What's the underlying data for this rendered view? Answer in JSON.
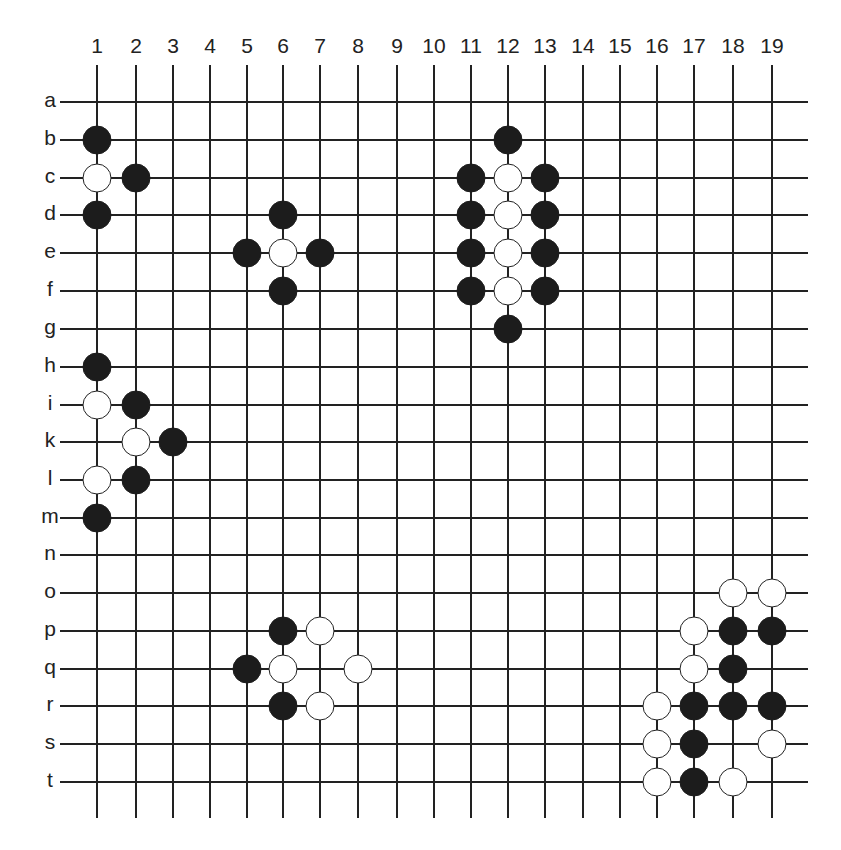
{
  "diagram": {
    "type": "go-board-diagram",
    "columns": [
      "1",
      "2",
      "3",
      "4",
      "5",
      "6",
      "7",
      "8",
      "9",
      "10",
      "11",
      "12",
      "13",
      "14",
      "15",
      "16",
      "17",
      "18",
      "19"
    ],
    "rows": [
      "a",
      "b",
      "c",
      "d",
      "e",
      "f",
      "g",
      "h",
      "i",
      "k",
      "l",
      "m",
      "n",
      "o",
      "p",
      "q",
      "r",
      "s",
      "t"
    ],
    "colors": {
      "black_stone": "#1c1c1c",
      "white_stone": "#ffffff",
      "grid": "#222222",
      "background": "#ffffff"
    },
    "stones": [
      {
        "row": "b",
        "col": 1,
        "color": "black"
      },
      {
        "row": "c",
        "col": 1,
        "color": "white"
      },
      {
        "row": "c",
        "col": 2,
        "color": "black"
      },
      {
        "row": "d",
        "col": 1,
        "color": "black"
      },
      {
        "row": "d",
        "col": 6,
        "color": "black"
      },
      {
        "row": "e",
        "col": 5,
        "color": "black"
      },
      {
        "row": "e",
        "col": 6,
        "color": "white"
      },
      {
        "row": "e",
        "col": 7,
        "color": "black"
      },
      {
        "row": "f",
        "col": 6,
        "color": "black"
      },
      {
        "row": "b",
        "col": 12,
        "color": "black"
      },
      {
        "row": "c",
        "col": 11,
        "color": "black"
      },
      {
        "row": "c",
        "col": 12,
        "color": "white"
      },
      {
        "row": "c",
        "col": 13,
        "color": "black"
      },
      {
        "row": "d",
        "col": 11,
        "color": "black"
      },
      {
        "row": "d",
        "col": 12,
        "color": "white"
      },
      {
        "row": "d",
        "col": 13,
        "color": "black"
      },
      {
        "row": "e",
        "col": 11,
        "color": "black"
      },
      {
        "row": "e",
        "col": 12,
        "color": "white"
      },
      {
        "row": "e",
        "col": 13,
        "color": "black"
      },
      {
        "row": "f",
        "col": 11,
        "color": "black"
      },
      {
        "row": "f",
        "col": 12,
        "color": "white"
      },
      {
        "row": "f",
        "col": 13,
        "color": "black"
      },
      {
        "row": "g",
        "col": 12,
        "color": "black"
      },
      {
        "row": "h",
        "col": 1,
        "color": "black"
      },
      {
        "row": "i",
        "col": 1,
        "color": "white"
      },
      {
        "row": "i",
        "col": 2,
        "color": "black"
      },
      {
        "row": "k",
        "col": 2,
        "color": "white"
      },
      {
        "row": "k",
        "col": 3,
        "color": "black"
      },
      {
        "row": "l",
        "col": 1,
        "color": "white"
      },
      {
        "row": "l",
        "col": 2,
        "color": "black"
      },
      {
        "row": "m",
        "col": 1,
        "color": "black"
      },
      {
        "row": "p",
        "col": 6,
        "color": "black"
      },
      {
        "row": "p",
        "col": 7,
        "color": "white"
      },
      {
        "row": "q",
        "col": 5,
        "color": "black"
      },
      {
        "row": "q",
        "col": 6,
        "color": "white"
      },
      {
        "row": "q",
        "col": 8,
        "color": "white"
      },
      {
        "row": "r",
        "col": 6,
        "color": "black"
      },
      {
        "row": "r",
        "col": 7,
        "color": "white"
      },
      {
        "row": "o",
        "col": 18,
        "color": "white"
      },
      {
        "row": "o",
        "col": 19,
        "color": "white"
      },
      {
        "row": "p",
        "col": 17,
        "color": "white"
      },
      {
        "row": "p",
        "col": 18,
        "color": "black"
      },
      {
        "row": "p",
        "col": 19,
        "color": "black"
      },
      {
        "row": "q",
        "col": 17,
        "color": "white"
      },
      {
        "row": "q",
        "col": 18,
        "color": "black"
      },
      {
        "row": "r",
        "col": 16,
        "color": "white"
      },
      {
        "row": "r",
        "col": 17,
        "color": "black"
      },
      {
        "row": "r",
        "col": 18,
        "color": "black"
      },
      {
        "row": "r",
        "col": 19,
        "color": "black"
      },
      {
        "row": "s",
        "col": 16,
        "color": "white"
      },
      {
        "row": "s",
        "col": 17,
        "color": "black"
      },
      {
        "row": "s",
        "col": 19,
        "color": "white"
      },
      {
        "row": "t",
        "col": 16,
        "color": "white"
      },
      {
        "row": "t",
        "col": 17,
        "color": "black"
      },
      {
        "row": "t",
        "col": 18,
        "color": "white"
      }
    ]
  }
}
